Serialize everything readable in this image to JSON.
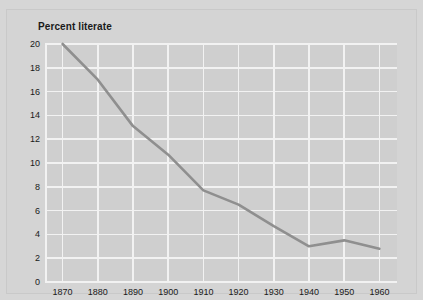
{
  "chart_data": {
    "type": "line",
    "title": "Percent literate",
    "xlabel": "",
    "ylabel": "",
    "x": [
      1870,
      1880,
      1890,
      1900,
      1910,
      1920,
      1930,
      1940,
      1950,
      1960
    ],
    "categories": [
      "1870",
      "1880",
      "1890",
      "1900",
      "1910",
      "1920",
      "1930",
      "1940",
      "1950",
      "1960"
    ],
    "values": [
      20.0,
      17.0,
      13.1,
      10.7,
      7.7,
      6.5,
      4.7,
      3.0,
      3.5,
      2.8
    ],
    "series": [
      {
        "name": "Percent literate",
        "values": [
          20.0,
          17.0,
          13.1,
          10.7,
          7.7,
          6.5,
          4.7,
          3.0,
          3.5,
          2.8
        ]
      }
    ],
    "xlim": [
      1865,
      1965
    ],
    "ylim": [
      0,
      20
    ],
    "xticks": [
      1870,
      1880,
      1890,
      1900,
      1910,
      1920,
      1930,
      1940,
      1950,
      1960
    ],
    "yticks": [
      0,
      2,
      4,
      6,
      8,
      10,
      12,
      14,
      16,
      18,
      20
    ],
    "ytick_labels": [
      "0",
      "2",
      "4",
      "6",
      "8",
      "10",
      "12",
      "14",
      "16",
      "18",
      "20"
    ],
    "xtick_labels": [
      "1870",
      "1880",
      "1890",
      "1900",
      "1910",
      "1920",
      "1930",
      "1940",
      "1950",
      "1960"
    ],
    "grid": true,
    "legend": false,
    "legend_position": "none",
    "line_color": "#8f8f8f",
    "grid_color": "#f2f2f2",
    "plot_bg_color": "#cfcfcf",
    "figure_bg_color": "#d4d4d4",
    "text_color": "#1a1a1a"
  }
}
